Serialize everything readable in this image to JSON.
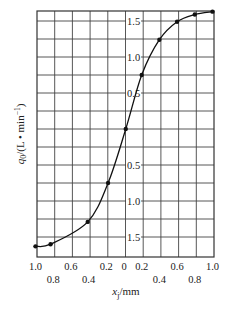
{
  "chart_data": {
    "type": "line",
    "title": "",
    "xlabel": "x_j/mm",
    "ylabel": "q0/(L·min⁻¹)",
    "xlim": [
      -1.0,
      1.0
    ],
    "ylim": [
      -1.8,
      1.8
    ],
    "grid": true,
    "legend": null,
    "x_tick_labels_row1": [
      "1.0",
      "0.6",
      "0.2",
      "0",
      "0.2",
      "0.6",
      "1.0"
    ],
    "x_tick_labels_row2": [
      "0.8",
      "0.4",
      "0.4",
      "0.8"
    ],
    "y_tick_labels_upper": [
      "1.5",
      "1.0",
      "0.5"
    ],
    "y_tick_labels_lower": [
      "0.5",
      "1.0",
      "1.5"
    ],
    "series": [
      {
        "name": "q0 vs x_j",
        "marker": "circle",
        "x": [
          -1.0,
          -0.83,
          -0.41,
          -0.18,
          0.02,
          0.2,
          0.4,
          0.6,
          0.8,
          1.0
        ],
        "y": [
          -1.63,
          -1.6,
          -1.29,
          -0.75,
          0.0,
          0.75,
          1.24,
          1.49,
          1.59,
          1.63
        ]
      }
    ]
  },
  "labels": {
    "ylabel_main": "q",
    "ylabel_sub": "0",
    "ylabel_rest": "/(L • min",
    "ylabel_sup": "−1",
    "ylabel_close": ")",
    "xlabel_main": "x",
    "xlabel_sub": "j",
    "xlabel_rest": "/mm"
  }
}
